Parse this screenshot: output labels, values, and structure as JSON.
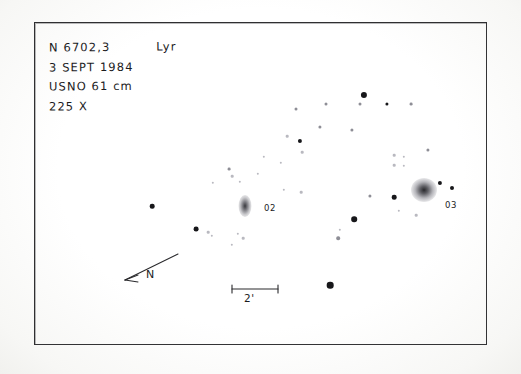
{
  "sketch": {
    "notes": {
      "object_designation": "N 6702,3",
      "constellation": "Lyr",
      "date": "3 SEPT 1984",
      "instrument": "USNO 61 cm",
      "magnification": "225 X"
    },
    "frame": {
      "x": 34,
      "y": 22,
      "width": 453,
      "height": 323,
      "border_color": "#2f2f31"
    },
    "orientation": {
      "label": "N",
      "arrow_direction": "down-left"
    },
    "scale": {
      "label": "2'",
      "bar_length_px": 48
    },
    "galaxies": [
      {
        "label": "02",
        "name": "NGC 6702",
        "x": 245,
        "y": 206,
        "width": 13,
        "height": 22,
        "shape": "elongated-oval",
        "brightness": "faint-diffuse"
      },
      {
        "label": "03",
        "name": "NGC 6703",
        "x": 424,
        "y": 190,
        "width": 26,
        "height": 24,
        "shape": "round-halo",
        "brightness": "bright-condensed"
      }
    ],
    "stars": [
      {
        "x": 364,
        "y": 95,
        "r": 3.1,
        "tone": "bright"
      },
      {
        "x": 387,
        "y": 104,
        "r": 1.6,
        "tone": "bright"
      },
      {
        "x": 360,
        "y": 104,
        "r": 1.5,
        "tone": "faint"
      },
      {
        "x": 326,
        "y": 104,
        "r": 1.5,
        "tone": "faint"
      },
      {
        "x": 411,
        "y": 104,
        "r": 1.4,
        "tone": "faint"
      },
      {
        "x": 296,
        "y": 109,
        "r": 1.5,
        "tone": "faint"
      },
      {
        "x": 320,
        "y": 127,
        "r": 1.6,
        "tone": "faint"
      },
      {
        "x": 352,
        "y": 130,
        "r": 1.6,
        "tone": "faint"
      },
      {
        "x": 300,
        "y": 141,
        "r": 2.1,
        "tone": "bright"
      },
      {
        "x": 287,
        "y": 136,
        "r": 1.3,
        "tone": "vfaint"
      },
      {
        "x": 302,
        "y": 152,
        "r": 1.3,
        "tone": "vfaint"
      },
      {
        "x": 394,
        "y": 155,
        "r": 1.3,
        "tone": "vfaint"
      },
      {
        "x": 404,
        "y": 157,
        "r": 1.2,
        "tone": "vfaint"
      },
      {
        "x": 394,
        "y": 165,
        "r": 1.3,
        "tone": "vfaint"
      },
      {
        "x": 404,
        "y": 166,
        "r": 1.2,
        "tone": "vfaint"
      },
      {
        "x": 428,
        "y": 150,
        "r": 1.6,
        "tone": "faint"
      },
      {
        "x": 229,
        "y": 169,
        "r": 1.4,
        "tone": "faint"
      },
      {
        "x": 232,
        "y": 176,
        "r": 1.3,
        "tone": "vfaint"
      },
      {
        "x": 240,
        "y": 182,
        "r": 1.2,
        "tone": "vfaint"
      },
      {
        "x": 258,
        "y": 174,
        "r": 1.2,
        "tone": "vfaint"
      },
      {
        "x": 213,
        "y": 183,
        "r": 1.2,
        "tone": "vfaint"
      },
      {
        "x": 284,
        "y": 190,
        "r": 1.2,
        "tone": "vfaint"
      },
      {
        "x": 152,
        "y": 206,
        "r": 2.3,
        "tone": "bright"
      },
      {
        "x": 196,
        "y": 229,
        "r": 2.4,
        "tone": "bright"
      },
      {
        "x": 208,
        "y": 232,
        "r": 1.3,
        "tone": "vfaint"
      },
      {
        "x": 212,
        "y": 236,
        "r": 1.2,
        "tone": "vfaint"
      },
      {
        "x": 238,
        "y": 234,
        "r": 1.2,
        "tone": "vfaint"
      },
      {
        "x": 243,
        "y": 238,
        "r": 1.3,
        "tone": "vfaint"
      },
      {
        "x": 232,
        "y": 245,
        "r": 1.2,
        "tone": "vfaint"
      },
      {
        "x": 301,
        "y": 192,
        "r": 1.3,
        "tone": "vfaint"
      },
      {
        "x": 370,
        "y": 196,
        "r": 1.6,
        "tone": "faint"
      },
      {
        "x": 394,
        "y": 197,
        "r": 2.3,
        "tone": "bright"
      },
      {
        "x": 440,
        "y": 183,
        "r": 2.1,
        "tone": "bright"
      },
      {
        "x": 452,
        "y": 188,
        "r": 2.0,
        "tone": "bright"
      },
      {
        "x": 399,
        "y": 211,
        "r": 1.2,
        "tone": "vfaint"
      },
      {
        "x": 416,
        "y": 215,
        "r": 1.3,
        "tone": "vfaint"
      },
      {
        "x": 354,
        "y": 219,
        "r": 2.8,
        "tone": "bright"
      },
      {
        "x": 338,
        "y": 238,
        "r": 1.8,
        "tone": "faint"
      },
      {
        "x": 340,
        "y": 230,
        "r": 1.2,
        "tone": "vfaint"
      },
      {
        "x": 330,
        "y": 285,
        "r": 3.3,
        "tone": "bright"
      },
      {
        "x": 264,
        "y": 157,
        "r": 1.2,
        "tone": "vfaint"
      },
      {
        "x": 281,
        "y": 163,
        "r": 1.2,
        "tone": "vfaint"
      }
    ]
  }
}
